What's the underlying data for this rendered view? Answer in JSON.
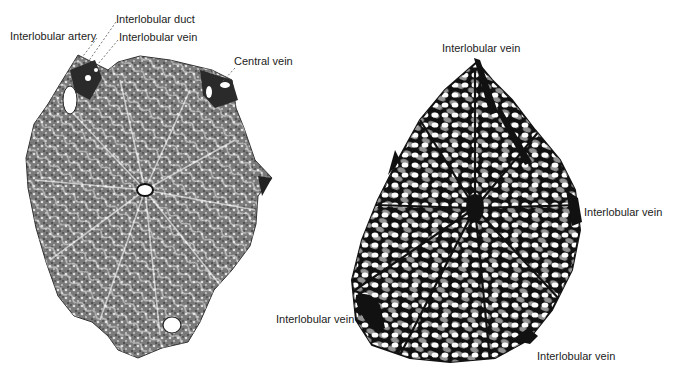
{
  "figure": {
    "left_panel": {
      "description": "histology-section-of-liver-lobule",
      "labels": {
        "interlobular_artery": "Interlobular artery",
        "interlobular_duct": "Interlobular duct",
        "interlobular_vein": "Interlobular vein",
        "central_vein": "Central vein"
      }
    },
    "right_panel": {
      "description": "vascular-cast-of-liver-lobule",
      "labels": {
        "top": "Interlobular vein",
        "right": "Interlobular vein",
        "bottom_left": "Interlobular vein",
        "bottom_right": "Interlobular vein"
      }
    },
    "colors": {
      "ink": "#111111",
      "tissue": "#6a6a6a",
      "background": "#ffffff"
    }
  }
}
